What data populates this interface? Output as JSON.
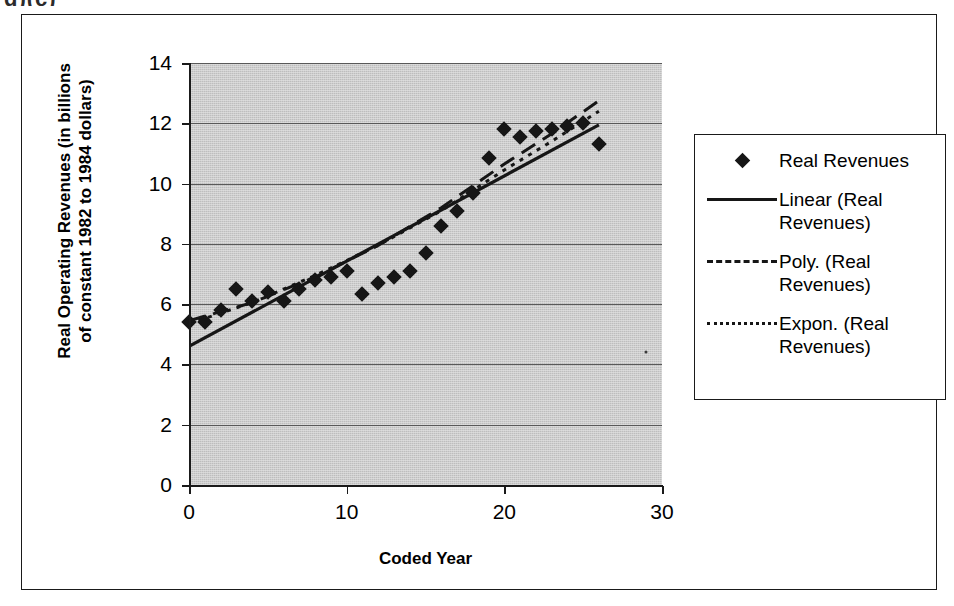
{
  "scan_artifact": {
    "top_text_fragment": "g)(c)",
    "stray_dot": {
      "x": 29.0,
      "y": 4.4
    }
  },
  "chart_data": {
    "type": "scatter",
    "title": "",
    "xlabel": "Coded Year",
    "ylabel_line1": "Real Operating Revenues (in billions",
    "ylabel_line2": "of constant 1982 to 1984 dollars)",
    "xlim": [
      0,
      30
    ],
    "ylim": [
      0,
      14
    ],
    "xticks": [
      0,
      10,
      20,
      30
    ],
    "yticks": [
      0,
      2,
      4,
      6,
      8,
      10,
      12,
      14
    ],
    "grid": "horizontal",
    "legend_position": "right",
    "plot_background": "#c9c9c9",
    "marker_color": "#161616",
    "series": [
      {
        "name": "Real Revenues",
        "kind": "scatter",
        "marker": "diamond",
        "x": [
          0,
          1,
          2,
          3,
          4,
          5,
          6,
          7,
          8,
          9,
          10,
          11,
          12,
          13,
          14,
          15,
          16,
          17,
          18,
          19,
          20,
          21,
          22,
          23,
          24,
          25,
          26
        ],
        "y": [
          5.4,
          5.4,
          5.8,
          6.5,
          6.1,
          6.4,
          6.1,
          6.5,
          6.8,
          6.9,
          7.1,
          6.35,
          6.7,
          6.9,
          7.1,
          7.7,
          8.6,
          9.1,
          9.7,
          10.85,
          11.8,
          11.55,
          11.75,
          11.8,
          11.9,
          12.0,
          11.3
        ]
      },
      {
        "name": "Linear (Real Revenues)",
        "kind": "trendline",
        "style": "solid",
        "x": [
          0,
          26
        ],
        "y": [
          4.6,
          11.95
        ]
      },
      {
        "name": "Poly. (Real Revenues)",
        "kind": "trendline",
        "style": "dashed",
        "x": [
          0,
          4,
          8,
          12,
          16,
          20,
          23,
          26
        ],
        "y": [
          5.45,
          6.05,
          6.9,
          7.95,
          9.2,
          10.65,
          11.65,
          12.75
        ]
      },
      {
        "name": "Expon. (Real Revenues)",
        "kind": "trendline",
        "style": "dotted",
        "x": [
          0,
          4,
          8,
          12,
          16,
          20,
          23,
          26
        ],
        "y": [
          5.35,
          6.05,
          6.95,
          7.95,
          9.1,
          10.45,
          11.4,
          12.4
        ]
      }
    ]
  },
  "legend": {
    "entries": [
      {
        "label": "Real Revenues",
        "key": "diamond-marker-icon"
      },
      {
        "label": "Linear (Real Revenues)",
        "key": "solid-line-icon"
      },
      {
        "label": "Poly. (Real Revenues)",
        "key": "dashed-line-icon"
      },
      {
        "label": "Expon. (Real Revenues)",
        "key": "dotted-line-icon"
      }
    ]
  }
}
